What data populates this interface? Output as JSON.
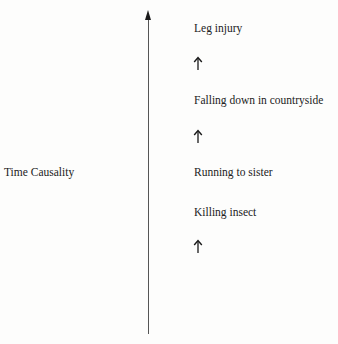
{
  "diagram": {
    "axis": {
      "label": "Time Causality",
      "direction": "up",
      "icon": "arrow-up-icon",
      "color": "#555555"
    },
    "events": [
      {
        "label": "Leg injury",
        "order": 4
      },
      {
        "label": "Falling down in countryside",
        "order": 3
      },
      {
        "label": "Running to sister",
        "order": 2
      },
      {
        "label": "Killing insect",
        "order": 1
      }
    ],
    "step_arrows": [
      {
        "icon": "arrow-up-icon",
        "between": [
          "Falling down in countryside",
          "Leg injury"
        ]
      },
      {
        "icon": "arrow-up-icon",
        "between": [
          "Running to sister",
          "Falling down in countryside"
        ]
      },
      {
        "icon": "arrow-up-icon",
        "below": "Killing insect"
      }
    ]
  }
}
